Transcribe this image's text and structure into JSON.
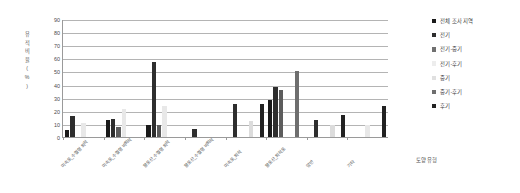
{
  "chart_data": {
    "type": "bar",
    "title": "",
    "xlabel": "토양 유형",
    "ylabel": "유적 비율(%)",
    "ylim": [
      0,
      90
    ],
    "yticks": [
      90,
      80,
      70,
      60,
      50,
      40,
      30,
      20,
      10,
      0
    ],
    "grid": true,
    "legend_position": "right",
    "categories": [
      "미숙토_수혈형 퇴적",
      "미숙토_수혈형 비퇴적",
      "황토산_수혈형 퇴적",
      "황토산_수혈형 비퇴적",
      "미숙토_퇴적",
      "황토산_퇴적토",
      "암반",
      "기타"
    ],
    "series": [
      {
        "name": "전체 조사 지역",
        "color": "#1a1a1a",
        "values": [
          5,
          13,
          9,
          0,
          0,
          28,
          0,
          0
        ]
      },
      {
        "name": "전기",
        "color": "#2e2e2e",
        "values": [
          16,
          14,
          57,
          6,
          25,
          38,
          13,
          0
        ]
      },
      {
        "name": "전기-중기",
        "color": "#5c5c5c",
        "values": [
          0,
          8,
          9,
          0,
          0,
          36,
          0,
          0
        ]
      },
      {
        "name": "전기-후기",
        "color": "#e8e8e8",
        "values": [
          11,
          21,
          24,
          0,
          0,
          0,
          0,
          9
        ]
      },
      {
        "name": "중기",
        "color": "#dcdcdc",
        "values": [
          0,
          0,
          0,
          0,
          12,
          0,
          9,
          0
        ]
      },
      {
        "name": "중기-후기",
        "color": "#6e6e6e",
        "values": [
          0,
          0,
          0,
          0,
          0,
          50,
          0,
          0
        ]
      },
      {
        "name": "후기",
        "color": "#222222",
        "values": [
          0,
          0,
          0,
          0,
          25,
          0,
          17,
          24
        ]
      }
    ]
  },
  "legend": {
    "items": [
      {
        "label": "전체 조사 지역",
        "color": "#1a1a1a"
      },
      {
        "label": "전기",
        "color": "#2e2e2e"
      },
      {
        "label": "전기-중기",
        "color": "#707070"
      },
      {
        "label": "전기-후기",
        "color": "#ededed"
      },
      {
        "label": "중기",
        "color": "#e0e0e0"
      },
      {
        "label": "중기-후기",
        "color": "#6e6e6e"
      },
      {
        "label": "후기",
        "color": "#222222"
      }
    ]
  }
}
